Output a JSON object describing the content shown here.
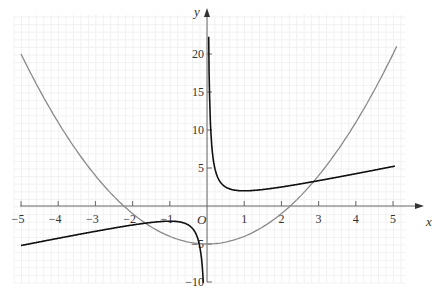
{
  "chart_data": {
    "type": "line",
    "title": "",
    "xlabel": "x",
    "ylabel": "y",
    "origin_label": "O",
    "xlim": [
      -5,
      5.3
    ],
    "ylim": [
      -10,
      23
    ],
    "grid": true,
    "x_ticks": [
      -5,
      -4,
      -3,
      -2,
      -1,
      1,
      2,
      3,
      4,
      5
    ],
    "y_ticks": [
      -10,
      -5,
      5,
      10,
      15,
      20
    ],
    "series": [
      {
        "name": "parabola",
        "equation": "y = x^2 - 5",
        "color": "#8a8a8a",
        "x": [
          -5,
          -4,
          -3,
          -2,
          -1,
          0,
          1,
          2,
          3,
          4,
          5.1
        ],
        "y": [
          20,
          11,
          4,
          -1,
          -4,
          -5,
          -4,
          -1,
          4,
          11,
          21.01
        ]
      },
      {
        "name": "hyperbola",
        "equation": "y = x + 1/x",
        "color": "#111111",
        "x": [
          -5,
          -4,
          -3,
          -2,
          -1,
          -0.5,
          -0.2,
          -0.1
        ],
        "y": [
          -5.2,
          -4.25,
          -3.33,
          -2.5,
          -2,
          -2.5,
          -5.2,
          -10.1
        ]
      },
      {
        "name": "hyperbola-right",
        "equation": "y = x + 1/x",
        "color": "#111111",
        "x": [
          0.045,
          0.1,
          0.2,
          0.5,
          1,
          2,
          3,
          4,
          5
        ],
        "y": [
          22.3,
          10.1,
          5.2,
          2.5,
          2,
          2.5,
          3.33,
          4.25,
          5.2
        ]
      }
    ]
  }
}
